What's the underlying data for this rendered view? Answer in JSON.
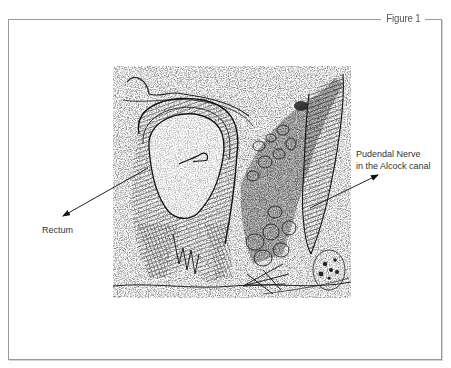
{
  "figure": {
    "label": "Figure 1",
    "border_color": "#9a9a9a",
    "illustration": {
      "subject": "anatomical cross-section of rectum and pelvic floor",
      "style": "stippled black-and-white engraving"
    },
    "callouts": [
      {
        "id": "rectum",
        "lines": [
          "Rectum"
        ]
      },
      {
        "id": "pudendal-nerve",
        "lines": [
          "Pudendal Nerve",
          "in the Alcock canal"
        ]
      }
    ]
  }
}
